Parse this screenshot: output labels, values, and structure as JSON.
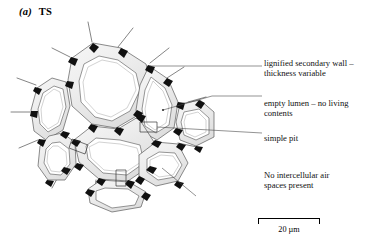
{
  "figure": {
    "panel_label": "(a)",
    "panel_title": "TS"
  },
  "annotations": {
    "wall": "lignified secondary wall –\nthickness variable",
    "lumen": "empty lumen – no living\ncontents",
    "pit": "simple pit",
    "airspace": "No intercellular air\nspaces present"
  },
  "scale": {
    "label": "20 µm"
  },
  "colors": {
    "ink": "#000000",
    "wall_fill_light": "#f2f2f2",
    "wall_fill_mid": "#e3e3e3",
    "wall_outline": "#4a4a4a",
    "junction": "#1a1a1a",
    "leader": "#555555",
    "background": "#ffffff"
  },
  "diagram": {
    "type": "micrograph-drawing",
    "cell_count": 8,
    "features": [
      "thick lignified secondary wall",
      "empty lumen",
      "simple pit",
      "no intercellular air spaces"
    ]
  }
}
